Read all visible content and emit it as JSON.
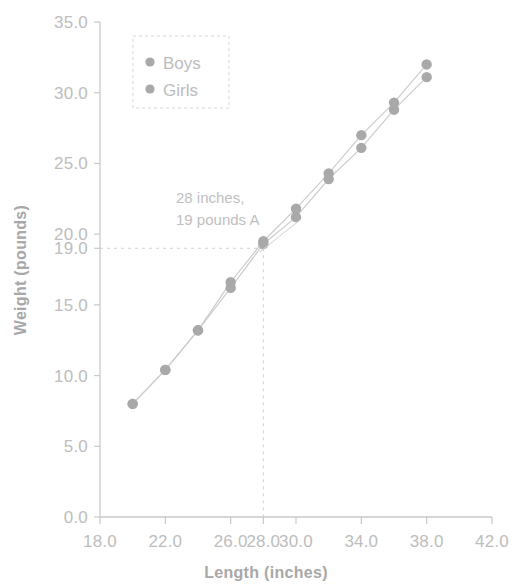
{
  "chart_data": {
    "type": "scatter",
    "title": "",
    "xlabel": "Length (inches)",
    "ylabel": "Weight (pounds)",
    "xlim": [
      18.0,
      42.0
    ],
    "ylim": [
      0.0,
      35.0
    ],
    "xticks": [
      "18.0",
      "22.0",
      "26.0",
      "28.0",
      "30.0",
      "34.0",
      "38.0",
      "42.0"
    ],
    "xtick_values": [
      18.0,
      22.0,
      26.0,
      28.0,
      30.0,
      34.0,
      38.0,
      42.0
    ],
    "yticks": [
      "0.0",
      "5.0",
      "10.0",
      "15.0",
      "19.0",
      "20.0",
      "25.0",
      "30.0",
      "35.0"
    ],
    "ytick_values": [
      0.0,
      5.0,
      10.0,
      15.0,
      19.0,
      20.0,
      25.0,
      30.0,
      35.0
    ],
    "grid": false,
    "legend_position": "upper left",
    "x": [
      20.0,
      22.0,
      24.0,
      26.0,
      28.0,
      30.0,
      32.0,
      34.0,
      36.0,
      38.0
    ],
    "series": [
      {
        "name": "Boys",
        "marker": "circle",
        "color": "#a9a9a9",
        "values": [
          8.0,
          10.4,
          13.2,
          16.2,
          19.3,
          21.2,
          23.9,
          26.1,
          28.8,
          31.1
        ]
      },
      {
        "name": "Girls",
        "marker": "circle",
        "color": "#a9a9a9",
        "values": [
          8.0,
          10.4,
          13.2,
          16.6,
          19.5,
          21.8,
          24.3,
          27.0,
          29.3,
          32.0
        ]
      }
    ],
    "annotations": [
      {
        "name": "point-a-callout",
        "text_line1": "28 inches,",
        "text_line2": "19 pounds A",
        "point_x": 28.0,
        "point_y": 19.0
      }
    ],
    "reference_lines": [
      {
        "name": "vertical-28-inches",
        "orientation": "vertical",
        "value": 28.0,
        "style": "dashed"
      },
      {
        "name": "horizontal-19-pounds",
        "orientation": "horizontal",
        "value": 19.0,
        "style": "dashed"
      }
    ]
  },
  "legend": {
    "items": [
      {
        "label": "Boys"
      },
      {
        "label": "Girls"
      }
    ]
  },
  "axes": {
    "x_title": "Length (inches)",
    "y_title": "Weight (pounds)"
  }
}
